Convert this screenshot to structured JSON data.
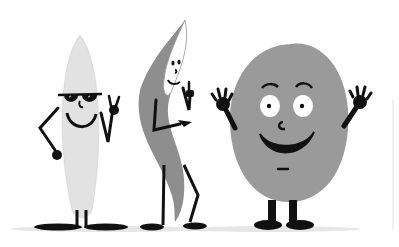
{
  "scene": {
    "description": "Cartoon illustration of three grain characters",
    "colors": {
      "background": "#ffffff",
      "ink": "#111111",
      "white_grain": "#e4e4e4",
      "wild_grain": "#8f8f8f",
      "round_grain": "#9a9a9a",
      "ground_shadow": "#e0e0e0",
      "eye_white": "#ffffff"
    },
    "characters": [
      {
        "id": "white-grain",
        "label": "long white grain with sunglasses, peace sign"
      },
      {
        "id": "wild-grain",
        "label": "curved dark grain giving thumbs up"
      },
      {
        "id": "round-grain",
        "label": "round brown grain waving both hands"
      }
    ]
  }
}
